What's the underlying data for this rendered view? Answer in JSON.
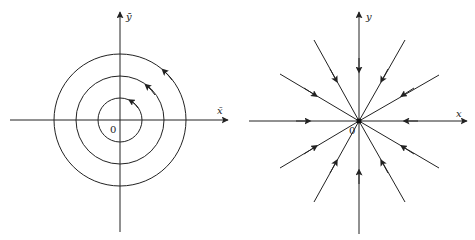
{
  "figures": [
    {
      "name": "center-phase-portrait",
      "origin": [
        120,
        120
      ],
      "x_axis_label": "x̄",
      "y_axis_label": "ȳ",
      "origin_label": "0",
      "circle_radii": [
        22,
        44,
        66
      ],
      "orbit_direction": "counterclockwise",
      "stroke_color": "#222222"
    },
    {
      "name": "stable-star-node-phase-portrait",
      "origin": [
        359,
        121
      ],
      "x_axis_label": "x",
      "y_axis_label": "y",
      "origin_label": "0",
      "trajectory_count": 12,
      "flow_direction": "inward toward origin",
      "stroke_color": "#222222"
    }
  ]
}
